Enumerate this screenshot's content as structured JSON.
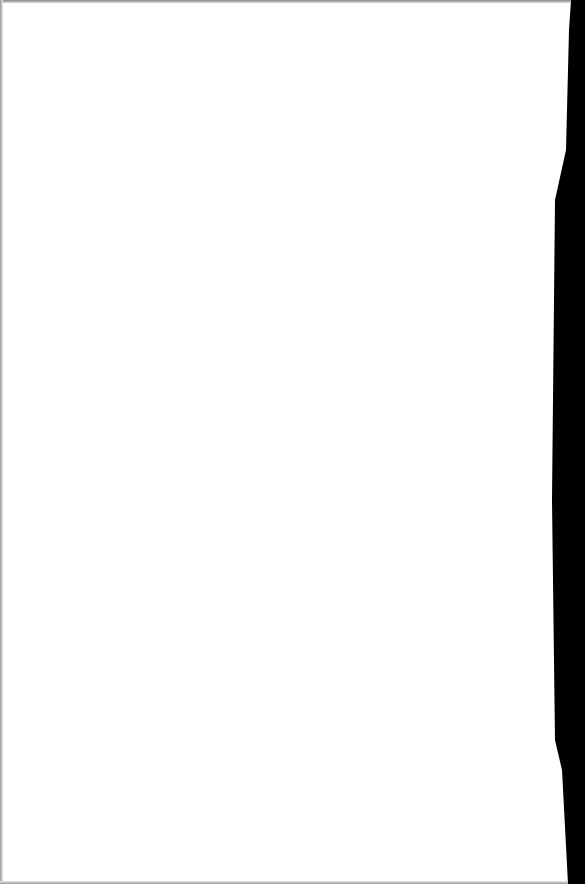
{
  "document": {
    "type": "scanned blank page",
    "background_color": "#ffffff",
    "edge_color": "#000000",
    "bleed_through_text": {
      "left_block": "",
      "right_block": ""
    },
    "legible_text": ""
  }
}
